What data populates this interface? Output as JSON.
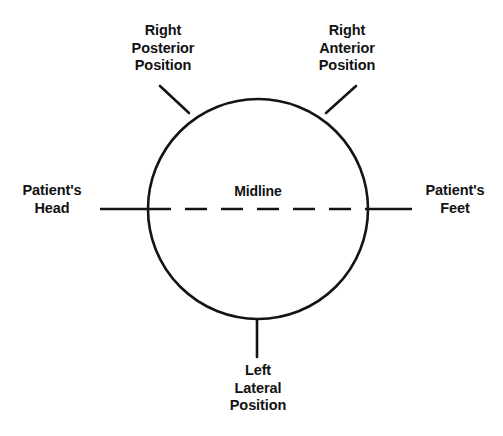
{
  "diagram": {
    "type": "anatomical-orientation-circle",
    "background_color": "#ffffff",
    "line_color": "#141414",
    "text_color": "#121212",
    "circle": {
      "center_x": 258,
      "center_y": 209,
      "radius": 110,
      "stroke_width": 2.6
    },
    "midline": {
      "label": "Midline",
      "y": 209,
      "x_start": 100,
      "x_end": 412,
      "style_inside_circle": "dashed",
      "style_outside_circle": "solid"
    },
    "labels": {
      "right_posterior": "Right\nPosterior\nPosition",
      "right_anterior": "Right\nAnterior\nPosition",
      "patients_head": "Patient's\nHead",
      "patients_feet": "Patient's\nFeet",
      "midline": "Midline",
      "left_lateral": "Left\nLateral\nPosition"
    },
    "leader_lines": [
      {
        "name": "right-posterior-leader",
        "from_x": 160,
        "from_y": 86,
        "to_x": 188,
        "to_y": 112
      },
      {
        "name": "right-anterior-leader",
        "from_x": 356,
        "from_y": 86,
        "to_x": 327,
        "to_y": 112
      },
      {
        "name": "left-lateral-leader",
        "from_x": 257,
        "from_y": 320,
        "to_x": 257,
        "to_y": 357
      }
    ]
  }
}
